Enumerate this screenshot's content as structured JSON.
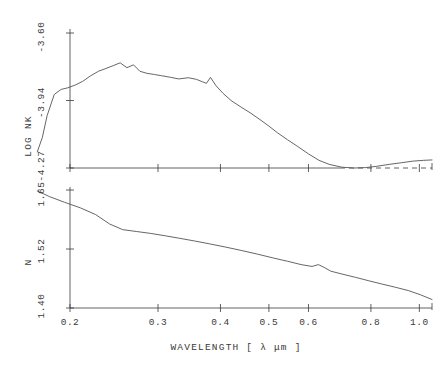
{
  "chart_data": [
    {
      "type": "line",
      "panel": "upper",
      "title": "",
      "xlabel": "WAVELENGTH [ λ μm ]",
      "ylabel": "LOG NK",
      "xscale": "log",
      "xlim": [
        0.17,
        1.1
      ],
      "ylim": [
        -4.27,
        -3.6
      ],
      "yticks": [
        -3.6,
        -3.94,
        -4.27
      ],
      "ytick_labels": [
        "-3.60",
        "-3.94",
        "-4.27"
      ],
      "xticks": [
        0.2,
        0.3,
        0.4,
        0.5,
        0.6,
        0.8,
        1.0
      ],
      "xtick_labels": [
        "0.2",
        "0.3",
        "0.4",
        "0.5",
        "0.6",
        "0.8",
        "1.0"
      ],
      "grid": false,
      "legend": "none",
      "x": [
        0.172,
        0.176,
        0.18,
        0.186,
        0.192,
        0.198,
        0.205,
        0.212,
        0.22,
        0.228,
        0.236,
        0.244,
        0.252,
        0.26,
        0.268,
        0.276,
        0.285,
        0.295,
        0.305,
        0.318,
        0.33,
        0.345,
        0.358,
        0.368,
        0.375,
        0.382,
        0.392,
        0.405,
        0.42,
        0.44,
        0.46,
        0.48,
        0.5,
        0.52,
        0.545,
        0.57,
        0.6,
        0.63,
        0.66,
        0.7,
        0.74,
        0.78,
        0.82,
        0.87,
        0.92,
        0.97,
        1.02,
        1.06
      ],
      "y": [
        -4.19,
        -4.12,
        -4.01,
        -3.905,
        -3.88,
        -3.872,
        -3.858,
        -3.84,
        -3.812,
        -3.79,
        -3.776,
        -3.762,
        -3.748,
        -3.772,
        -3.758,
        -3.79,
        -3.8,
        -3.806,
        -3.812,
        -3.82,
        -3.828,
        -3.822,
        -3.83,
        -3.842,
        -3.85,
        -3.82,
        -3.862,
        -3.9,
        -3.935,
        -3.968,
        -3.998,
        -4.03,
        -4.062,
        -4.095,
        -4.13,
        -4.162,
        -4.2,
        -4.232,
        -4.252,
        -4.266,
        -4.27,
        -4.268,
        -4.262,
        -4.252,
        -4.244,
        -4.236,
        -4.232,
        -4.23
      ]
    },
    {
      "type": "line",
      "panel": "lower",
      "title": "",
      "xlabel": "WAVELENGTH [ λ μm ]",
      "ylabel": "N",
      "xscale": "log",
      "xlim": [
        0.17,
        1.1
      ],
      "ylim": [
        1.4,
        1.65
      ],
      "yticks": [
        1.65,
        1.52,
        1.4
      ],
      "ytick_labels": [
        "1.65",
        "1.52",
        "1.40"
      ],
      "xticks": [
        0.2,
        0.3,
        0.4,
        0.5,
        0.6,
        0.8,
        1.0
      ],
      "xtick_labels": [
        "0.2",
        "0.3",
        "0.4",
        "0.5",
        "0.6",
        "0.8",
        "1.0"
      ],
      "grid": false,
      "legend": "none",
      "x": [
        0.172,
        0.182,
        0.195,
        0.21,
        0.225,
        0.24,
        0.255,
        0.272,
        0.29,
        0.31,
        0.33,
        0.355,
        0.38,
        0.41,
        0.44,
        0.475,
        0.51,
        0.545,
        0.58,
        0.61,
        0.628,
        0.645,
        0.665,
        0.7,
        0.745,
        0.79,
        0.84,
        0.895,
        0.95,
        1.005,
        1.06
      ],
      "y": [
        1.648,
        1.636,
        1.624,
        1.612,
        1.598,
        1.578,
        1.566,
        1.562,
        1.558,
        1.553,
        1.548,
        1.542,
        1.536,
        1.529,
        1.522,
        1.514,
        1.506,
        1.499,
        1.492,
        1.488,
        1.492,
        1.486,
        1.478,
        1.472,
        1.465,
        1.458,
        1.451,
        1.444,
        1.437,
        1.428,
        1.418
      ]
    }
  ],
  "axes": {
    "upper": {
      "ytick_labels": [
        "-3.60",
        "-3.94",
        "-4.27"
      ],
      "title": "LOG NK"
    },
    "lower": {
      "ytick_labels": [
        "1.65",
        "1.52",
        "1.40"
      ],
      "title": "N"
    },
    "x": {
      "tick_labels": [
        "0.2",
        "0.3",
        "0.4",
        "0.5",
        "0.6",
        "0.8",
        "1.0"
      ],
      "title": "WAVELENGTH [ λ μm ]"
    }
  },
  "style": {
    "curve_color": "#555555",
    "axis_color": "#3a3a3a",
    "background": "#ffffff"
  }
}
